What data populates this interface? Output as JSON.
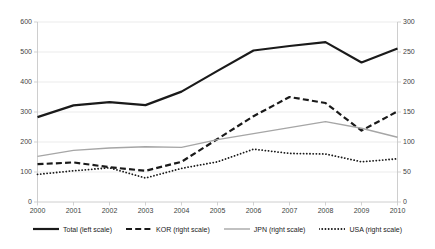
{
  "chart_data": {
    "type": "line",
    "title": "",
    "xlabel": "",
    "ylabel": "",
    "categories": [
      "2000",
      "2001",
      "2002",
      "2003",
      "2004",
      "2005",
      "2006",
      "2007",
      "2008",
      "2009",
      "2010"
    ],
    "axes": {
      "left": {
        "label": "",
        "ticks": [
          "0",
          "100",
          "200",
          "300",
          "400",
          "500",
          "600"
        ],
        "tick_values": [
          0,
          100,
          200,
          300,
          400,
          500,
          600
        ],
        "ylim": [
          0,
          600
        ]
      },
      "right": {
        "label": "",
        "ticks": [
          "0",
          "50",
          "100",
          "150",
          "200",
          "250",
          "300"
        ],
        "tick_values": [
          0,
          50,
          100,
          150,
          200,
          250,
          300
        ],
        "ylim": [
          0,
          300
        ]
      }
    },
    "grid": true,
    "grid_axis": "y",
    "legend_position": "bottom",
    "series": [
      {
        "name": "Total (left scale)",
        "axis": "left",
        "style": "solid",
        "color": "#1a1a1a",
        "width": 2.2,
        "values": [
          283,
          322,
          333,
          323,
          368,
          437,
          505,
          520,
          533,
          465,
          512
        ]
      },
      {
        "name": "KOR (right scale)",
        "axis": "right",
        "style": "dashed",
        "color": "#1a1a1a",
        "width": 2.2,
        "values": [
          63,
          66,
          58,
          52,
          67,
          105,
          143,
          175,
          165,
          119,
          151
        ]
      },
      {
        "name": "JPN (right scale)",
        "axis": "right",
        "style": "solid",
        "color": "#a6a6a6",
        "width": 1.4,
        "values": [
          76,
          86,
          90,
          92,
          91,
          104,
          114,
          124,
          134,
          123,
          108
        ]
      },
      {
        "name": "USA (right scale)",
        "axis": "right",
        "style": "dotted",
        "color": "#1a1a1a",
        "width": 1.8,
        "values": [
          46,
          52,
          57,
          40,
          56,
          67,
          88,
          81,
          80,
          67,
          72
        ]
      }
    ]
  },
  "colors": {
    "grid": "#e3e3e3",
    "axis": "#c8c8c8",
    "tick_text": "#3f3f3f",
    "legend_text": "#1a1a1a",
    "series_dark": "#1a1a1a",
    "series_gray": "#a6a6a6",
    "background": "#ffffff"
  }
}
